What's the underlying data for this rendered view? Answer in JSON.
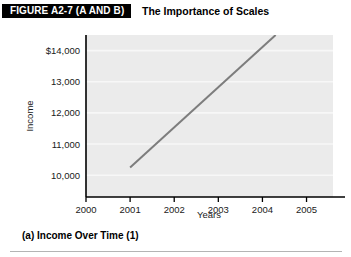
{
  "header": {
    "figure_tag": "FIGURE A2-7 (A AND B)",
    "figure_title": "The Importance of Scales"
  },
  "caption": {
    "text": "(a)  Income Over Time (1)"
  },
  "colors": {
    "tag_background": "#000000",
    "tag_text": "#ffffff",
    "plot_background": "#ebebeb",
    "gridline": "#f7f7f7",
    "axis": "#000000",
    "series_line": "#7d7d7d",
    "rule": "#b4b4b4"
  },
  "chart_data": {
    "type": "line",
    "title": "The Importance of Scales",
    "xlabel": "Years",
    "ylabel": "Income",
    "xlim": [
      2000,
      2005.6
    ],
    "ylim": [
      9300,
      14500
    ],
    "xticks": [
      2000,
      2001,
      2002,
      2003,
      2004,
      2005
    ],
    "xtick_labels": [
      "2000",
      "2001",
      "2002",
      "2003",
      "2004",
      "2005"
    ],
    "yticks": [
      10000,
      11000,
      12000,
      13000,
      14000
    ],
    "ytick_labels": [
      "10,000",
      "11,000",
      "12,000",
      "13,000",
      "$14,000"
    ],
    "grid": true,
    "grid_axis": "y",
    "legend": false,
    "series": [
      {
        "name": "Income",
        "x": [
          2001,
          2004.3
        ],
        "values": [
          10250,
          14500
        ]
      }
    ],
    "annotations": []
  }
}
